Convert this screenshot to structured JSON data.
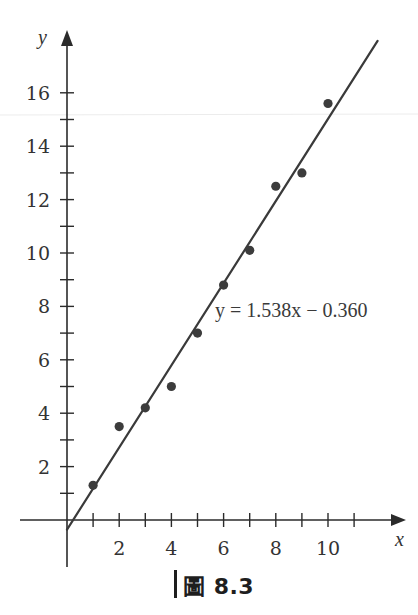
{
  "chart_data": {
    "type": "scatter",
    "title": "",
    "xlabel": "x",
    "ylabel": "y",
    "x": [
      1,
      2,
      3,
      4,
      5,
      6,
      7,
      8,
      9,
      10
    ],
    "series": [
      {
        "name": "data points",
        "values": [
          1.3,
          3.5,
          4.2,
          5.0,
          7.0,
          8.8,
          10.1,
          12.5,
          13.0,
          15.6
        ]
      }
    ],
    "regression_line": {
      "equation": "y = 1.538x − 0.360",
      "slope": 1.538,
      "intercept": -0.36,
      "x_range": [
        0,
        11.9
      ]
    },
    "xlim": [
      -1.8,
      12.8
    ],
    "ylim": [
      -1.8,
      18.5
    ],
    "x_ticks": [
      1,
      2,
      3,
      4,
      5,
      6,
      7,
      8,
      9,
      10,
      11
    ],
    "x_tick_labels": [
      "2",
      "4",
      "6",
      "8",
      "10"
    ],
    "x_tick_label_values": [
      2,
      4,
      6,
      8,
      10
    ],
    "y_ticks": [
      1,
      2,
      3,
      4,
      5,
      6,
      7,
      8,
      9,
      10,
      11,
      12,
      13,
      14,
      15,
      16
    ],
    "y_tick_labels": [
      "2",
      "4",
      "6",
      "8",
      "10",
      "12",
      "14",
      "16"
    ],
    "y_tick_label_values": [
      2,
      4,
      6,
      8,
      10,
      12,
      14,
      16
    ],
    "grid": false,
    "legend": null,
    "annotations": [
      "y = 1.538x − 0.360"
    ]
  },
  "caption": {
    "label": "圖 8.3"
  },
  "colors": {
    "axis": "#2b2b2b",
    "line": "#3a3a3a",
    "points": "#3c3c3c",
    "text": "#333333"
  }
}
